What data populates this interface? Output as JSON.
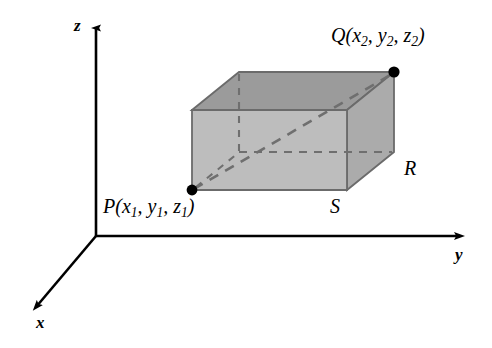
{
  "figure": {
    "background": "#ffffff"
  },
  "axes": {
    "x_label": "x",
    "y_label": "y",
    "z_label": "z",
    "color": "#000000",
    "origin": {
      "x": 96,
      "y": 236
    },
    "z_tip": {
      "x": 96,
      "y": 22
    },
    "y_tip": {
      "x": 466,
      "y": 236
    },
    "x_tip": {
      "x": 30,
      "y": 312
    }
  },
  "box": {
    "top_face_color": "#9b9b9b",
    "front_face_color": "#bdbdbd",
    "right_face_color": "#ababab",
    "edge_color": "#6b6b6b",
    "hidden_edge_color": "#6f6f6f",
    "front_bottom_left": {
      "x": 192,
      "y": 190
    },
    "front_top_left": {
      "x": 192,
      "y": 110
    },
    "front_bottom_right": {
      "x": 347,
      "y": 190
    },
    "front_top_right": {
      "x": 347,
      "y": 110
    },
    "back_bottom_left": {
      "x": 239,
      "y": 152
    },
    "back_top_left": {
      "x": 239,
      "y": 72
    },
    "back_bottom_right": {
      "x": 394,
      "y": 152
    },
    "back_top_right": {
      "x": 394,
      "y": 72
    }
  },
  "points": {
    "p": {
      "name": "P",
      "coords": [
        "x",
        "y",
        "z"
      ],
      "subscript": "1",
      "label_text": "P(x1, y1, z1)",
      "dot": {
        "x": 192,
        "y": 190
      },
      "dot_color": "#000000"
    },
    "q": {
      "name": "Q",
      "coords": [
        "x",
        "y",
        "z"
      ],
      "subscript": "2",
      "label_text": "Q(x2, y2, z2)",
      "dot": {
        "x": 394,
        "y": 72
      },
      "dot_color": "#000000"
    }
  },
  "vertices": {
    "r_label": "R",
    "s_label": "S"
  },
  "diagonal": {
    "style": "dashed",
    "from": "P",
    "to": "Q",
    "color": "#6f6f6f"
  }
}
